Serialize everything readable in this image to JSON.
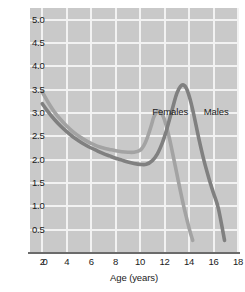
{
  "chart_data": {
    "type": "line",
    "title": "",
    "xlabel": "Age (years)",
    "ylabel": "Height gain (inches/year)",
    "xlim": [
      1,
      18
    ],
    "ylim": [
      0,
      5.25
    ],
    "grid": true,
    "legend_position": "inline-annotations",
    "x_ticks": [
      2,
      4,
      6,
      8,
      10,
      12,
      14,
      16,
      18
    ],
    "x_tick_labels": [
      "2",
      "4",
      "6",
      "8",
      "10",
      "12",
      "14",
      "16",
      "18"
    ],
    "y_ticks": [
      0,
      0.5,
      1.0,
      1.5,
      2.0,
      2.5,
      3.0,
      3.5,
      4.0,
      4.5,
      5.0
    ],
    "y_tick_labels": [
      "0",
      "0.5",
      "1.0",
      "1.5",
      "2.0",
      "2.5",
      "3.0",
      "3.5",
      "4.0",
      "4.5",
      "5.0"
    ],
    "plot_background": "#c9c9c9",
    "gridline_color": "#f2f2f2",
    "axis_color": "#6b6b6b",
    "series": [
      {
        "name": "Females",
        "color": "#a3a3a3",
        "label_x": 11.0,
        "label_y": 3.02,
        "x": [
          2.0,
          2.5,
          3.0,
          3.5,
          4.0,
          4.5,
          5.0,
          5.5,
          6.0,
          6.5,
          7.0,
          7.5,
          8.0,
          8.5,
          9.0,
          9.5,
          10.0,
          10.3,
          10.6,
          10.9,
          11.1,
          11.3,
          11.5,
          11.7,
          11.9,
          12.1,
          12.4,
          12.7,
          13.0,
          13.3,
          13.6,
          13.9,
          14.1,
          14.3
        ],
        "y": [
          3.45,
          3.22,
          3.02,
          2.86,
          2.72,
          2.6,
          2.5,
          2.42,
          2.35,
          2.29,
          2.25,
          2.22,
          2.19,
          2.17,
          2.16,
          2.16,
          2.2,
          2.3,
          2.48,
          2.72,
          2.9,
          3.0,
          3.05,
          3.02,
          2.92,
          2.76,
          2.45,
          2.08,
          1.7,
          1.32,
          0.96,
          0.64,
          0.44,
          0.27
        ]
      },
      {
        "name": "Males",
        "color": "#808080",
        "label_x": 15.2,
        "label_y": 3.02,
        "x": [
          2.0,
          2.5,
          3.0,
          3.5,
          4.0,
          4.5,
          5.0,
          5.5,
          6.0,
          6.5,
          7.0,
          7.5,
          8.0,
          8.5,
          9.0,
          9.5,
          10.0,
          10.5,
          11.0,
          11.4,
          11.8,
          12.1,
          12.4,
          12.7,
          13.0,
          13.3,
          13.55,
          13.8,
          14.1,
          14.4,
          14.8,
          15.2,
          15.6,
          16.0,
          16.4,
          16.9
        ],
        "y": [
          3.2,
          3.02,
          2.86,
          2.72,
          2.6,
          2.49,
          2.4,
          2.32,
          2.25,
          2.19,
          2.13,
          2.08,
          2.03,
          1.99,
          1.95,
          1.92,
          1.9,
          1.9,
          1.98,
          2.12,
          2.35,
          2.58,
          2.86,
          3.15,
          3.42,
          3.57,
          3.6,
          3.52,
          3.28,
          2.95,
          2.45,
          2.0,
          1.62,
          1.28,
          0.95,
          0.27
        ]
      }
    ]
  }
}
